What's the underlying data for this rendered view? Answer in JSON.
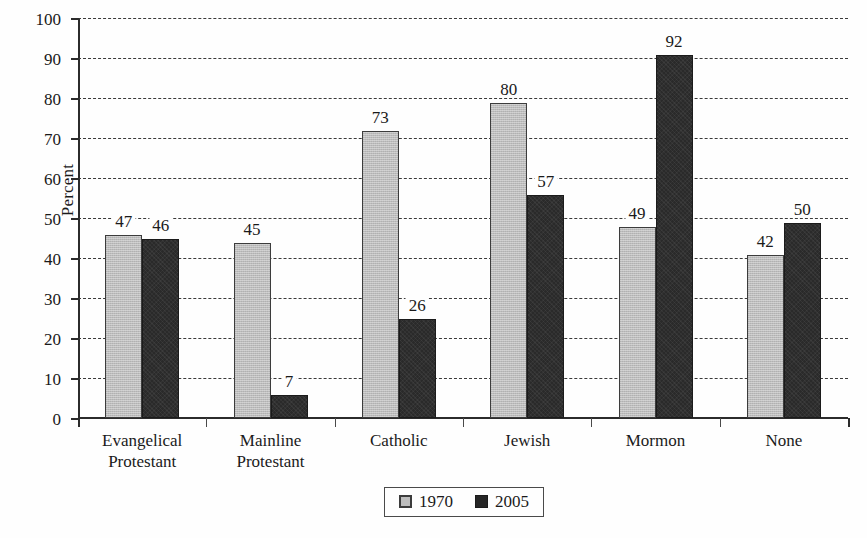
{
  "chart_data": {
    "type": "bar",
    "title": "",
    "xlabel": "",
    "ylabel": "Percent",
    "ylim": [
      0,
      100
    ],
    "ytick_step": 10,
    "yticks": [
      100,
      90,
      80,
      70,
      60,
      50,
      40,
      30,
      20,
      10,
      0
    ],
    "grid": true,
    "legend_position": "bottom-center",
    "categories": [
      "Evangelical\nProtestant",
      "Mainline\nProtestant",
      "Catholic",
      "Jewish",
      "Mormon",
      "None"
    ],
    "series": [
      {
        "name": "1970",
        "color": "#bcbcbc",
        "values": [
          47,
          45,
          73,
          80,
          49,
          42
        ]
      },
      {
        "name": "2005",
        "color": "#2a2a2a",
        "values": [
          46,
          7,
          26,
          57,
          92,
          50
        ]
      }
    ]
  },
  "legend": {
    "items": [
      {
        "label": "1970",
        "swatch": "light-gray-square"
      },
      {
        "label": "2005",
        "swatch": "dark-square"
      }
    ]
  }
}
